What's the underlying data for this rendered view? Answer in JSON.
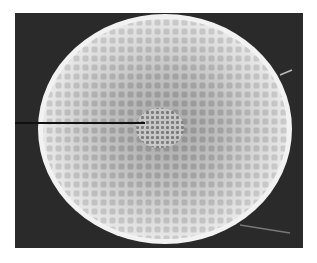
{
  "image": {
    "subject": "SEM micrograph of a reticulate spherical microstructure",
    "background_color": "#2a2a2a",
    "sphere_color": "#e8e8e8",
    "cell_color": "#8a8a8a",
    "pointer_color": "#111111",
    "frame": {
      "x": 15,
      "y": 13,
      "width": 288,
      "height": 235
    },
    "sphere": {
      "cx": 165,
      "cy": 129,
      "rx": 127,
      "ry": 115
    },
    "pointer": {
      "x1": 15,
      "y1": 123,
      "x2": 145,
      "y2": 123
    }
  }
}
